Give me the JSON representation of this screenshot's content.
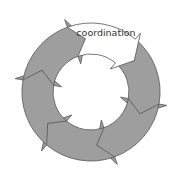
{
  "diagram": {
    "type": "cycle",
    "segments": [
      {
        "id": "seg-1",
        "label": "coordination",
        "fill": "#ffffff",
        "highlighted": true
      },
      {
        "id": "seg-2",
        "label": "",
        "fill": "#9e9e9e"
      },
      {
        "id": "seg-3",
        "label": "",
        "fill": "#9e9e9e"
      },
      {
        "id": "seg-4",
        "label": "",
        "fill": "#9e9e9e"
      },
      {
        "id": "seg-5",
        "label": "",
        "fill": "#9e9e9e"
      },
      {
        "id": "seg-6",
        "label": "",
        "fill": "#9e9e9e"
      }
    ],
    "colors": {
      "segment_fill": "#9e9e9e",
      "highlight_fill": "#ffffff",
      "stroke": "#555555"
    }
  }
}
